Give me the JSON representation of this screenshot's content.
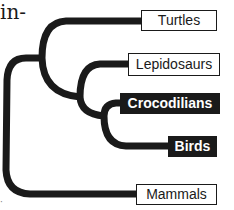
{
  "text_fragments": {
    "top_left": "in-",
    "bottom_left": "·"
  },
  "diagram": {
    "type": "cladogram",
    "line_color": "#1a1a1a",
    "highlight_fill": "#1a1a1a",
    "highlight_text": "#ffffff",
    "plain_fill": "#ffffff",
    "plain_text": "#1a1a1a",
    "taxa": [
      {
        "label": "Turtles",
        "highlighted": false
      },
      {
        "label": "Lepidosaurs",
        "highlighted": false
      },
      {
        "label": "Crocodilians",
        "highlighted": true
      },
      {
        "label": "Birds",
        "highlighted": true
      },
      {
        "label": "Mammals",
        "highlighted": false
      }
    ],
    "topology": "(Mammals,(Turtles,(Lepidosaurs,(Crocodilians,Birds))))"
  }
}
